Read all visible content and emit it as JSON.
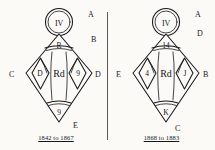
{
  "page": {
    "background_color": "#fbfaf7",
    "ink_color": "#17171d",
    "divider_color": "#5c5c5c"
  },
  "diagrams": [
    {
      "id": "mark-1842-1867",
      "caption": "1842 to 1867",
      "circle_label": "IV",
      "top_cell": "R",
      "left_cell": "D",
      "center_cell": "Rd",
      "right_cell": "9",
      "bottom_cell": "9",
      "outer_labels": {
        "top_right": "A",
        "upper_right": "B",
        "left": "C",
        "right": "D",
        "bottom_right": "E"
      }
    },
    {
      "id": "mark-1868-1883",
      "caption": "1868 to 1883",
      "circle_label": "IV",
      "top_cell": "14",
      "left_cell": "4",
      "center_cell": "Rd",
      "right_cell": "J",
      "bottom_cell": "K",
      "outer_labels": {
        "top_right": "A",
        "upper_right": "D",
        "left": "E",
        "right": "B",
        "bottom_right": "C"
      }
    }
  ]
}
